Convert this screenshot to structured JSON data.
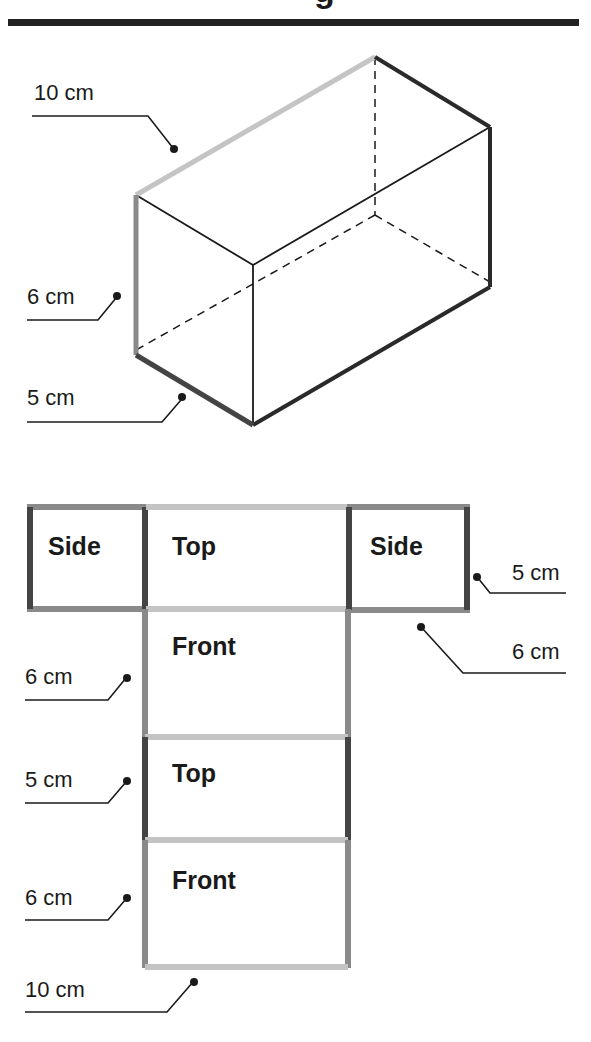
{
  "header": {
    "title_fragment": "g",
    "rule_color": "#222222"
  },
  "colors": {
    "length_edge": "#c4c4c4",
    "height_edge": "#8a8a8a",
    "width_edge": "#444444",
    "thin_line": "#1a1a1a",
    "leader": "#1a1a1a"
  },
  "prism": {
    "dimensions": {
      "length": "10 cm",
      "height": "6 cm",
      "width": "5 cm"
    },
    "labels": {
      "length": "10 cm",
      "height": "6 cm",
      "width": "5 cm"
    }
  },
  "net": {
    "faces": [
      {
        "name": "side-left",
        "label": "Side"
      },
      {
        "name": "top",
        "label": "Top"
      },
      {
        "name": "side-right",
        "label": "Side"
      },
      {
        "name": "front",
        "label": "Front"
      },
      {
        "name": "top-2",
        "label": "Top"
      },
      {
        "name": "front-2",
        "label": "Front"
      }
    ],
    "labels": {
      "side_width": "5 cm",
      "side_height": "6 cm",
      "front_height": "6 cm",
      "top_width": "5 cm",
      "back_height": "6 cm",
      "length": "10 cm"
    }
  }
}
